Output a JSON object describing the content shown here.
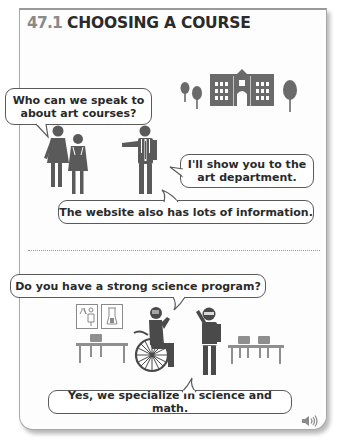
{
  "section": {
    "number": "47.1",
    "title": "CHOOSING A COURSE"
  },
  "scene1": {
    "bubbles": [
      {
        "id": "q1",
        "text_line1": "Who can we speak to",
        "text_line2": "about art courses?"
      },
      {
        "id": "a1",
        "text_line1": "I'll show you to the",
        "text_line2": "art department."
      },
      {
        "id": "a2",
        "text": "The website also has lots of information."
      }
    ],
    "illustrations": [
      "trees-icon",
      "school-building-icon",
      "tree-icon",
      "two-students-icon",
      "staff-member-pointing-icon"
    ]
  },
  "scene2": {
    "bubbles": [
      {
        "id": "q2",
        "text": "Do you have a strong science program?"
      },
      {
        "id": "a3",
        "text": "Yes, we specialize in science and math."
      }
    ],
    "illustrations": [
      "lab-posters-icon",
      "desk-icon",
      "wheelchair-student-icon",
      "teacher-waving-icon",
      "desks-icon"
    ]
  },
  "audio": {
    "icon": "speaker-icon"
  },
  "colors": {
    "pictogram": "#5c5c5c",
    "furniture": "#8f8f8f",
    "number": "#8a8a8a",
    "border": "#a8a8a8"
  }
}
